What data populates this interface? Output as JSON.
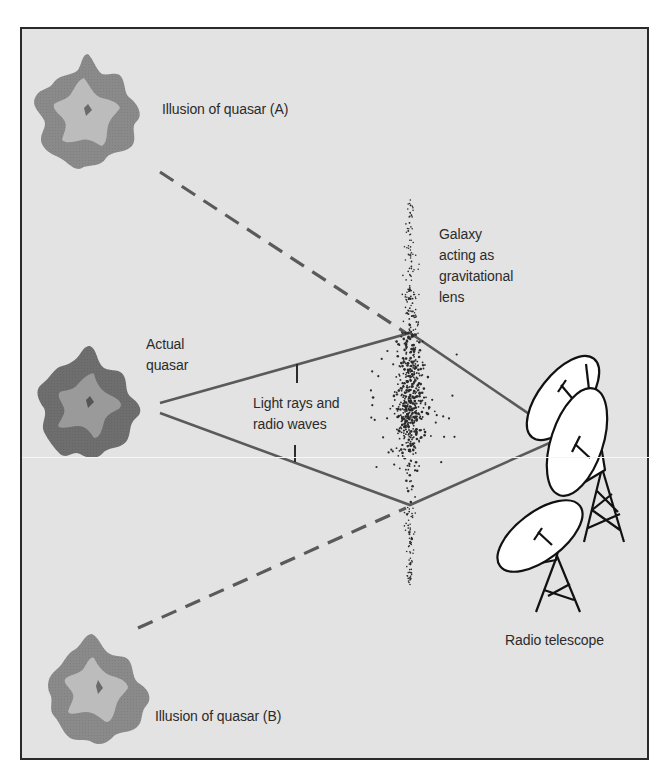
{
  "figure": {
    "labels": {
      "illusion_a": "Illusion of quasar (A)",
      "illusion_b": "Illusion of quasar (B)",
      "actual_quasar": [
        "Actual",
        "quasar"
      ],
      "galaxy_lens": [
        "Galaxy",
        "acting as",
        "gravitational",
        "lens"
      ],
      "light_rays": [
        "Light rays and",
        "radio waves"
      ],
      "radio_telescope": "Radio telescope"
    },
    "colors": {
      "background": "#e3e3e3",
      "frame": "#2a2a2a",
      "quasar_outer": "#8a8a8a",
      "quasar_outer_dark": "#6e6e6e",
      "quasar_inner": "#b9b9b9",
      "ray_line": "#5a5a5a",
      "dish_fill": "#ffffff",
      "text": "#2b2b2b"
    },
    "elements": {
      "quasars": [
        {
          "id": "illusion-a",
          "cx": 88,
          "cy": 110
        },
        {
          "id": "actual",
          "cx": 90,
          "cy": 405
        },
        {
          "id": "illusion-b",
          "cx": 100,
          "cy": 690
        }
      ],
      "lens_points": {
        "upper": [
          410,
          333
        ],
        "lower": [
          410,
          505
        ]
      },
      "telescope_focus": [
        563,
        437
      ]
    }
  }
}
